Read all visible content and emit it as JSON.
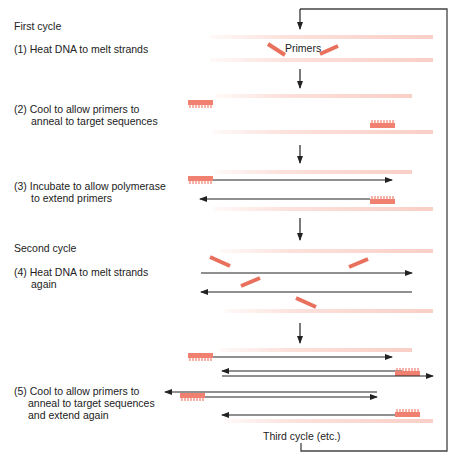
{
  "figure": {
    "colors": {
      "primer": "#f08070",
      "primer_edge": "#e0604c",
      "template_strand": "#fbd9d2",
      "new_strand": "#222222",
      "loop_line": "#444444"
    }
  },
  "sections": {
    "first_cycle": "First cycle",
    "second_cycle": "Second cycle",
    "third_cycle": "Third cycle (etc.)"
  },
  "steps": [
    {
      "num": "(1)",
      "line1": "(1) Heat DNA to melt strands",
      "line2": ""
    },
    {
      "num": "(2)",
      "line1": "(2) Cool to allow primers to",
      "line2": "anneal to target sequences"
    },
    {
      "num": "(3)",
      "line1": "(3) Incubate to allow polymerase",
      "line2": "to extend primers"
    },
    {
      "num": "(4)",
      "line1": "(4) Heat DNA to melt strands",
      "line2": "again"
    },
    {
      "num": "(5)",
      "line1": "(5) Cool to allow primers to",
      "line2": "anneal to target sequences",
      "line3": "and extend again"
    }
  ],
  "annotations": {
    "primers_label": "Primers"
  }
}
